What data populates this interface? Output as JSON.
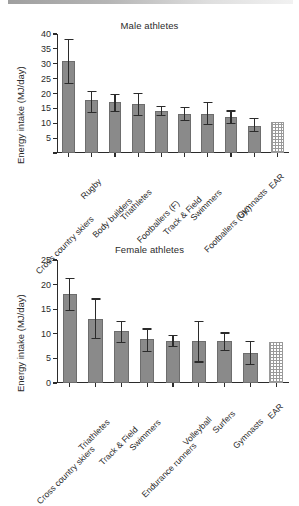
{
  "page": {
    "background": "#ffffff",
    "bar_color": "#8a8a8a",
    "axis_color": "#2b2b2b",
    "ear_pattern": "checkered"
  },
  "chart_data": [
    {
      "type": "bar",
      "id": "male",
      "title": "Male athletes",
      "xlabel": "",
      "ylabel": "Energy intake (MJ/day)",
      "ylim": [
        0,
        40
      ],
      "yticks": [
        0,
        5,
        10,
        15,
        20,
        25,
        30,
        35,
        40
      ],
      "ytick_labels": [
        "",
        "5",
        "10",
        "15",
        "20",
        "25",
        "30",
        "35",
        "40"
      ],
      "grid": false,
      "legend": "none",
      "categories": [
        "Cross country skiers",
        "Rugby",
        "Body builders",
        "Triathletes",
        "Footballers (F)",
        "Track & Field",
        "Swimmers",
        "Footballers (UK)",
        "Gymnasts",
        "EAR"
      ],
      "values": [
        30.8,
        17.7,
        17.1,
        16.5,
        14.2,
        13.2,
        13.0,
        12.0,
        9.2,
        10.5
      ],
      "err_low": [
        23.5,
        13.9,
        14.2,
        12.8,
        12.7,
        11.1,
        9.9,
        10.2,
        7.4,
        null
      ],
      "err_high": [
        38.3,
        21.0,
        20.0,
        20.1,
        15.8,
        15.6,
        17.2,
        14.3,
        11.8,
        null
      ],
      "ear_index": 9
    },
    {
      "type": "bar",
      "id": "female",
      "title": "Female athletes",
      "xlabel": "",
      "ylabel": "Energy intake (MJ/day)",
      "ylim": [
        0,
        25
      ],
      "yticks": [
        0,
        5,
        10,
        15,
        20,
        25
      ],
      "ytick_labels": [
        "0",
        "5",
        "10",
        "15",
        "20",
        "25"
      ],
      "grid": false,
      "legend": "none",
      "categories": [
        "Cross country skiers",
        "Triathletes",
        "Track & Field",
        "Swimmers",
        "Endurance runners",
        "Volleyball",
        "Surfers",
        "Gymnasts",
        "EAR"
      ],
      "values": [
        18.1,
        13.0,
        10.5,
        9.0,
        8.6,
        8.6,
        8.6,
        6.1,
        8.3
      ],
      "err_low": [
        14.9,
        9.2,
        8.4,
        6.6,
        7.6,
        4.4,
        6.7,
        3.8,
        null
      ],
      "err_high": [
        21.3,
        17.2,
        12.7,
        11.1,
        9.7,
        12.6,
        10.3,
        8.5,
        null
      ],
      "ear_index": 8
    }
  ]
}
